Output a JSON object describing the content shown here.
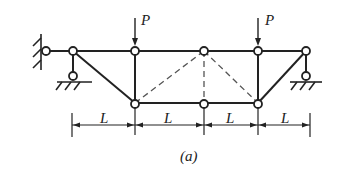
{
  "figure": {
    "caption": "(a)",
    "load_labels": [
      "P",
      "P"
    ],
    "dimension_labels": [
      "L",
      "L",
      "L",
      "L"
    ],
    "colors": {
      "ink": "#222222",
      "dashed": "#555555",
      "background": "#ffffff"
    }
  },
  "structure": {
    "type": "truss",
    "supports": [
      "fixed-wall-pin-left",
      "roller-left",
      "roller-right"
    ],
    "members_solid": "top chord, bottom chord, verticals, end diagonals",
    "members_dashed": "inner diagonals and middle vertical"
  }
}
